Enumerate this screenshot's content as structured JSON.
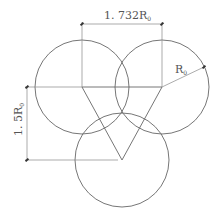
{
  "diagram": {
    "type": "geometry",
    "circles": [
      {
        "id": "left",
        "cx": 82,
        "cy": 87,
        "r": 47
      },
      {
        "id": "right",
        "cx": 162,
        "cy": 87,
        "r": 47
      },
      {
        "id": "bottom",
        "cx": 122,
        "cy": 160,
        "r": 47
      }
    ],
    "triangle": [
      [
        82,
        87
      ],
      [
        162,
        87
      ],
      [
        122,
        160
      ]
    ],
    "labels": {
      "horizontal_dim": {
        "main": "1. 732R",
        "sub": "0"
      },
      "vertical_dim": {
        "main": "1. 5R",
        "sub": "0"
      },
      "radius": {
        "main": "R",
        "sub": "0"
      }
    },
    "colors": {
      "line": "#555555",
      "thin": "#888888"
    }
  }
}
